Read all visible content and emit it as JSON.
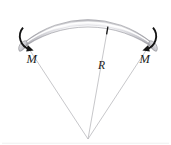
{
  "figure": {
    "background_color": "#ffffff",
    "labels": {
      "moment_left": "M",
      "moment_right": "M",
      "radius": "R"
    },
    "icons": {
      "moment_arrow_left": "curved-arrow-counterclockwise-icon",
      "moment_arrow_right": "curved-arrow-clockwise-icon",
      "radius_tick": "tick-mark-icon"
    },
    "colors": {
      "tube_dark": "#6e6e74",
      "tube_mid": "#a8a8ae",
      "tube_light": "#f2f2f4",
      "tube_highlight": "#ffffff",
      "tube_shadow": "#5a5a60",
      "radial_line": "#b9b9bd",
      "arrow": "#141414",
      "label": "#1b1b1b",
      "outline": "#8c8c92"
    },
    "geometry": {
      "center_x": 88,
      "center_y": 139,
      "radius_outer": 112,
      "radius_inner": 100,
      "arc_start_deg": 232,
      "arc_end_deg": 308,
      "radial_line_count": 3
    }
  }
}
